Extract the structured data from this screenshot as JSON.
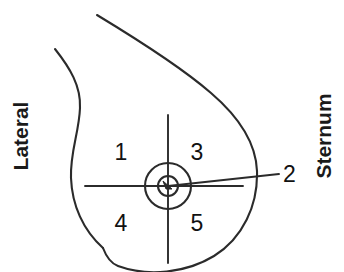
{
  "diagram": {
    "stroke_color": "#2b2b2b",
    "text_color": "#111111",
    "background_color": "#ffffff",
    "orientation_labels": {
      "left": "Lateral",
      "right": "Sternum"
    },
    "quadrant_numbers": [
      {
        "id": "1",
        "label": "1",
        "position": "upper-outer"
      },
      {
        "id": "3",
        "label": "3",
        "position": "upper-inner"
      },
      {
        "id": "4",
        "label": "4",
        "position": "lower-outer"
      },
      {
        "id": "5",
        "label": "5",
        "position": "lower-inner"
      }
    ],
    "callouts": [
      {
        "id": "2",
        "label": "2",
        "points_to": "nipple-areola-center"
      }
    ]
  }
}
